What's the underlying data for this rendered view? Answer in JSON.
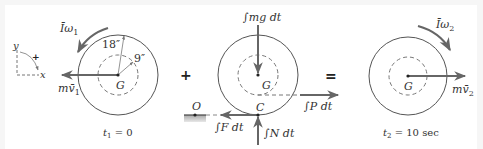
{
  "figure": {
    "type": "impulse-momentum diagram",
    "operators": {
      "plus": "+",
      "equals": "="
    },
    "colors": {
      "line": "#555555",
      "arrow": "#6b6b6b",
      "dashed": "#777777",
      "ground": "#b0b0b0",
      "text": "#333333"
    },
    "panel_1": {
      "time_label": {
        "var": "t",
        "sub": "1",
        "rest": " = 0"
      },
      "angular_momentum": {
        "base": "Īω",
        "sub": "1"
      },
      "linear_momentum": {
        "base": "mv̄",
        "sub": "1"
      },
      "outer_radius_label": "18″",
      "inner_radius_label": "9″",
      "center_label": "G",
      "axes": {
        "x": "x",
        "y": "y",
        "positive_sense": "+"
      }
    },
    "panel_2": {
      "weight_impulse": "∫mg dt",
      "pull_impulse": "∫P dt",
      "friction_impulse": "∫F dt",
      "normal_impulse": "∫N dt",
      "center_label": "G",
      "contact_label": "C",
      "origin_label": "O"
    },
    "panel_3": {
      "time_label": {
        "var": "t",
        "sub": "2",
        "rest": " = 10 sec"
      },
      "angular_momentum": {
        "base": "Īω",
        "sub": "2"
      },
      "linear_momentum": {
        "base": "mv̄",
        "sub": "2"
      },
      "center_label": "G"
    }
  }
}
